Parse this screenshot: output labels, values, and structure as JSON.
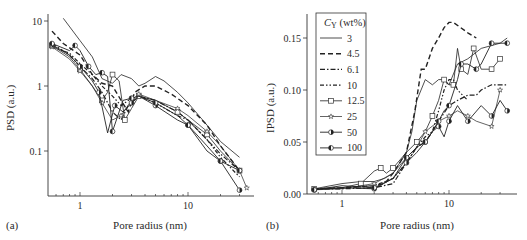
{
  "chart_data": [
    {
      "panel": "(a)",
      "type": "line",
      "title": "",
      "xlabel": "Pore radius (nm)",
      "ylabel": "PSD (a.u.)",
      "xscale": "log",
      "yscale": "log",
      "xlim": [
        0.55,
        40
      ],
      "ylim": [
        0.02,
        12
      ],
      "xticks": [
        "1",
        "10"
      ],
      "yticks": [
        "0.1",
        "1",
        "10"
      ],
      "grid": false,
      "legend": "shared with panel (b)",
      "series": [
        {
          "name": "3",
          "x": [
            0.7,
            1.0,
            1.3,
            1.6,
            2.0,
            2.4,
            3.0,
            3.5,
            4.0,
            5.0,
            6.0,
            8.0,
            10,
            15,
            20,
            30
          ],
          "y": [
            11,
            5,
            2.8,
            1.3,
            1.1,
            1.5,
            1.3,
            1.0,
            1.1,
            1.4,
            1.2,
            0.8,
            0.55,
            0.25,
            0.14,
            0.08
          ]
        },
        {
          "name": "4.5",
          "x": [
            0.55,
            0.7,
            1.0,
            1.3,
            1.6,
            2.0,
            2.4,
            2.8,
            3.2,
            4.0,
            5.0,
            7.0,
            10,
            15,
            20,
            30
          ],
          "y": [
            7,
            4.5,
            3.0,
            1.5,
            1.1,
            1.0,
            0.6,
            0.4,
            0.8,
            1.0,
            1.0,
            0.75,
            0.5,
            0.25,
            0.12,
            0.05
          ]
        },
        {
          "name": "6.1",
          "x": [
            0.55,
            0.8,
            1.0,
            1.3,
            1.6,
            2.0,
            2.4,
            2.8,
            3.5,
            5.0,
            8.0,
            10,
            15,
            20,
            30
          ],
          "y": [
            4.5,
            3.0,
            2.0,
            1.3,
            0.8,
            0.4,
            0.3,
            0.5,
            0.7,
            0.6,
            0.4,
            0.3,
            0.15,
            0.09,
            0.05
          ]
        },
        {
          "name": "10",
          "x": [
            0.55,
            0.8,
            1.0,
            1.3,
            1.6,
            2.0,
            2.4,
            2.8,
            3.5,
            5.0,
            8.0,
            10,
            15,
            20,
            30
          ],
          "y": [
            4.0,
            3.2,
            2.2,
            1.5,
            1.0,
            0.7,
            0.5,
            0.6,
            0.7,
            0.55,
            0.35,
            0.3,
            0.15,
            0.08,
            0.04
          ]
        },
        {
          "name": "12.5",
          "x": [
            0.55,
            0.8,
            1.0,
            1.3,
            1.6,
            1.8,
            2.0,
            2.3,
            2.6,
            3.0,
            3.5,
            5.0,
            8.0,
            10,
            15,
            20,
            30
          ],
          "y": [
            4.2,
            2.8,
            1.8,
            1.0,
            0.6,
            0.8,
            1.5,
            1.2,
            0.3,
            0.45,
            0.7,
            0.6,
            0.4,
            0.3,
            0.18,
            0.1,
            0.05
          ]
        },
        {
          "name": "25",
          "x": [
            0.55,
            0.8,
            1.0,
            1.3,
            1.6,
            2.0,
            2.4,
            3.0,
            3.5,
            5.0,
            8.0,
            10,
            15,
            20,
            30,
            35
          ],
          "y": [
            4.0,
            2.6,
            1.7,
            1.0,
            0.55,
            0.3,
            0.35,
            0.6,
            0.75,
            0.6,
            0.45,
            0.35,
            0.2,
            0.12,
            0.05,
            0.027
          ]
        },
        {
          "name": "50",
          "x": [
            0.55,
            0.8,
            1.0,
            1.3,
            1.5,
            1.8,
            2.1,
            2.5,
            3.0,
            3.5,
            5.0,
            8.0,
            10,
            15,
            20,
            30
          ],
          "y": [
            4.3,
            3.0,
            2.0,
            1.2,
            0.8,
            0.19,
            0.5,
            0.4,
            0.55,
            0.7,
            0.5,
            0.3,
            0.25,
            0.12,
            0.07,
            0.025
          ]
        },
        {
          "name": "100",
          "x": [
            0.55,
            0.8,
            0.9,
            1.0,
            1.2,
            1.4,
            1.6,
            1.8,
            2.0,
            2.5,
            3.0,
            3.5,
            5.0,
            8.0,
            10,
            15,
            20,
            30
          ],
          "y": [
            4.5,
            3.5,
            4.2,
            3.5,
            2.0,
            1.5,
            1.6,
            1.4,
            0.2,
            0.6,
            0.65,
            0.7,
            0.55,
            0.35,
            0.25,
            0.1,
            0.07,
            0.05
          ]
        }
      ]
    },
    {
      "panel": "(b)",
      "type": "line",
      "title": "",
      "xlabel": "Pore radius (nm)",
      "ylabel": "IPSD (a.u.)",
      "xscale": "log",
      "yscale": "linear",
      "xlim": [
        0.55,
        38
      ],
      "ylim": [
        0.0,
        0.17
      ],
      "xticks": [
        "1",
        "10"
      ],
      "yticks": [
        "0.00",
        "0.05",
        "0.10",
        "0.15"
      ],
      "grid": false,
      "legend_position": "upper left (inside)",
      "series": [
        {
          "name": "3",
          "x": [
            0.55,
            1.0,
            1.5,
            2.0,
            2.5,
            3.0,
            4.0,
            4.5,
            5.0,
            6.0,
            7.0,
            8.0,
            9.0,
            10,
            12,
            15,
            20,
            30,
            35
          ],
          "y": [
            0.005,
            0.01,
            0.012,
            0.012,
            0.015,
            0.02,
            0.04,
            0.06,
            0.09,
            0.11,
            0.105,
            0.11,
            0.11,
            0.105,
            0.125,
            0.13,
            0.14,
            0.145,
            0.15
          ]
        },
        {
          "name": "4.5",
          "x": [
            0.55,
            1.0,
            2.0,
            2.5,
            3.0,
            4.0,
            4.8,
            5.5,
            6.0,
            7.0,
            8.0,
            9.0,
            10,
            11,
            15,
            18
          ],
          "y": [
            0.005,
            0.006,
            0.008,
            0.01,
            0.02,
            0.04,
            0.08,
            0.12,
            0.12,
            0.14,
            0.15,
            0.16,
            0.165,
            0.165,
            0.155,
            0.15
          ]
        },
        {
          "name": "6.1",
          "x": [
            0.55,
            1.0,
            2.0,
            3.0,
            4.0,
            5.0,
            6.0,
            7.0,
            8.0,
            10,
            12,
            15,
            18,
            20,
            25,
            30,
            35
          ],
          "y": [
            0.005,
            0.005,
            0.006,
            0.01,
            0.03,
            0.045,
            0.05,
            0.06,
            0.07,
            0.085,
            0.09,
            0.095,
            0.095,
            0.1,
            0.105,
            0.105,
            0.105
          ]
        },
        {
          "name": "10",
          "x": [
            0.55,
            1.0,
            2.0,
            3.0,
            4.0,
            5.0,
            6.0,
            7.0,
            8.0,
            9.0,
            10,
            11,
            12,
            15
          ],
          "y": [
            0.005,
            0.006,
            0.008,
            0.015,
            0.03,
            0.045,
            0.055,
            0.06,
            0.08,
            0.1,
            0.11,
            0.11,
            0.1,
            0.09
          ]
        },
        {
          "name": "12.5",
          "x": [
            0.55,
            1.0,
            1.5,
            2.0,
            2.3,
            2.6,
            3.0,
            4.0,
            5.0,
            6.0,
            7.0,
            8.0,
            9.0,
            10,
            11,
            12,
            13,
            15,
            17,
            20,
            25,
            30
          ],
          "y": [
            0.005,
            0.006,
            0.01,
            0.022,
            0.025,
            0.02,
            0.025,
            0.04,
            0.05,
            0.06,
            0.075,
            0.09,
            0.11,
            0.105,
            0.105,
            0.14,
            0.12,
            0.115,
            0.14,
            0.12,
            0.12,
            0.13
          ]
        },
        {
          "name": "25",
          "x": [
            0.55,
            1.0,
            2.0,
            3.0,
            4.0,
            5.0,
            6.0,
            8.0,
            10,
            12,
            15,
            18,
            25,
            30
          ],
          "y": [
            0.004,
            0.005,
            0.01,
            0.02,
            0.035,
            0.045,
            0.06,
            0.07,
            0.075,
            0.08,
            0.075,
            0.07,
            0.065,
            0.1
          ]
        },
        {
          "name": "50",
          "x": [
            0.55,
            1.0,
            2.0,
            3.0,
            4.0,
            5.0,
            6.0,
            7.0,
            8.0,
            9.0,
            10,
            12,
            15,
            20,
            25,
            30,
            35
          ],
          "y": [
            0.004,
            0.006,
            0.005,
            0.015,
            0.03,
            0.04,
            0.05,
            0.06,
            0.065,
            0.055,
            0.07,
            0.085,
            0.07,
            0.085,
            0.075,
            0.09,
            0.08
          ]
        },
        {
          "name": "100",
          "x": [
            0.55,
            1.0,
            2.0,
            3.0,
            4.0,
            5.0,
            6.0,
            7.0,
            8.0,
            9.0,
            10,
            12,
            13,
            15,
            18,
            20,
            25,
            30,
            35
          ],
          "y": [
            0.004,
            0.008,
            0.006,
            0.015,
            0.035,
            0.045,
            0.05,
            0.06,
            0.07,
            0.08,
            0.085,
            0.11,
            0.125,
            0.125,
            0.12,
            0.125,
            0.145,
            0.145,
            0.145
          ]
        }
      ]
    }
  ],
  "panels": {
    "a": {
      "label": "(a)",
      "xlabel": "Pore radius (nm)",
      "ylabel": "PSD (a.u.)",
      "yticks": [
        "10",
        "1",
        "0.1"
      ],
      "xticks": [
        "1",
        "10"
      ]
    },
    "b": {
      "label": "(b)",
      "xlabel": "Pore radius (nm)",
      "ylabel": "IPSD (a.u.)",
      "yticks": [
        "0.15",
        "0.10",
        "0.05",
        "0.00"
      ],
      "xticks": [
        "1",
        "10"
      ]
    }
  },
  "legend": {
    "title": "C",
    "title_subscript": "Y",
    "title_unit": " (wt%)",
    "entries": [
      {
        "label": "3",
        "style": "solid",
        "marker": "none"
      },
      {
        "label": "4.5",
        "style": "dash",
        "marker": "none"
      },
      {
        "label": "6.1",
        "style": "dash-dot",
        "marker": "none"
      },
      {
        "label": "10",
        "style": "dash-dot-dot",
        "marker": "none"
      },
      {
        "label": "12.5",
        "style": "solid",
        "marker": "open-square"
      },
      {
        "label": "25",
        "style": "solid",
        "marker": "open-star"
      },
      {
        "label": "50",
        "style": "solid",
        "marker": "half-filled-circle-right"
      },
      {
        "label": "100",
        "style": "solid",
        "marker": "half-filled-circle-left"
      }
    ]
  }
}
